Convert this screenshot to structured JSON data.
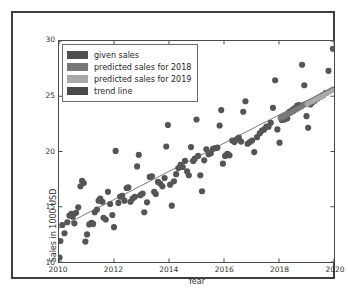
{
  "chart_data": {
    "type": "scatter",
    "title": "",
    "xlabel": "Year",
    "ylabel": "Sales in 1000 USD",
    "xlim": [
      2010,
      2020
    ],
    "ylim": [
      10,
      30
    ],
    "xticks": [
      "2010",
      "2012",
      "2014",
      "2016",
      "2018",
      "2020"
    ],
    "xtick_values": [
      2010,
      2012,
      2014,
      2016,
      2018,
      2020
    ],
    "yticks": [
      "10",
      "15",
      "20",
      "25",
      "30"
    ],
    "ytick_values": [
      10,
      15,
      20,
      25,
      30
    ],
    "grid": false,
    "legend_position": "upper left",
    "legend": [
      {
        "label": "given sales",
        "color": "#4f4f4f"
      },
      {
        "label": "predicted sales for 2018",
        "color": "#777777"
      },
      {
        "label": "predicted sales for 2019",
        "color": "#a8a8a8"
      },
      {
        "label": "trend line",
        "color": "#4a4a4a"
      }
    ],
    "series": [
      {
        "name": "given sales",
        "type": "scatter",
        "color": "#555555",
        "marker_size": 3.1,
        "points": [
          [
            2010.02,
            10.4
          ],
          [
            2010.05,
            11.9
          ],
          [
            2010.12,
            13.35
          ],
          [
            2010.2,
            12.6
          ],
          [
            2010.3,
            13.6
          ],
          [
            2010.38,
            14.2
          ],
          [
            2010.45,
            14.35
          ],
          [
            2010.5,
            14.1
          ],
          [
            2010.56,
            13.5
          ],
          [
            2010.62,
            14.45
          ],
          [
            2010.7,
            14.95
          ],
          [
            2010.78,
            16.85
          ],
          [
            2010.84,
            17.35
          ],
          [
            2010.9,
            17.15
          ],
          [
            2010.96,
            11.85
          ],
          [
            2011.02,
            12.5
          ],
          [
            2011.1,
            13.4
          ],
          [
            2011.18,
            13.55
          ],
          [
            2011.24,
            13.45
          ],
          [
            2011.3,
            14.5
          ],
          [
            2011.38,
            14.75
          ],
          [
            2011.44,
            15.55
          ],
          [
            2011.5,
            15.75
          ],
          [
            2011.58,
            15.45
          ],
          [
            2011.62,
            14.0
          ],
          [
            2011.7,
            13.85
          ],
          [
            2011.78,
            16.35
          ],
          [
            2011.86,
            15.25
          ],
          [
            2011.94,
            14.25
          ],
          [
            2012.0,
            13.15
          ],
          [
            2012.06,
            20.05
          ],
          [
            2012.16,
            15.35
          ],
          [
            2012.22,
            15.9
          ],
          [
            2012.3,
            16.0
          ],
          [
            2012.38,
            15.55
          ],
          [
            2012.46,
            16.7
          ],
          [
            2012.52,
            16.75
          ],
          [
            2012.6,
            15.45
          ],
          [
            2012.68,
            15.75
          ],
          [
            2012.76,
            15.9
          ],
          [
            2012.84,
            18.65
          ],
          [
            2012.9,
            19.7
          ],
          [
            2012.96,
            16.05
          ],
          [
            2013.04,
            16.2
          ],
          [
            2013.1,
            14.5
          ],
          [
            2013.2,
            15.4
          ],
          [
            2013.3,
            17.7
          ],
          [
            2013.38,
            17.75
          ],
          [
            2013.46,
            16.35
          ],
          [
            2013.52,
            16.15
          ],
          [
            2013.6,
            17.25
          ],
          [
            2013.68,
            17.1
          ],
          [
            2013.76,
            16.85
          ],
          [
            2013.84,
            17.6
          ],
          [
            2013.9,
            20.45
          ],
          [
            2013.96,
            22.4
          ],
          [
            2014.04,
            17.0
          ],
          [
            2014.1,
            15.1
          ],
          [
            2014.18,
            17.3
          ],
          [
            2014.26,
            17.95
          ],
          [
            2014.34,
            18.5
          ],
          [
            2014.42,
            18.8
          ],
          [
            2014.5,
            18.6
          ],
          [
            2014.58,
            19.15
          ],
          [
            2014.66,
            18.2
          ],
          [
            2014.72,
            17.85
          ],
          [
            2014.8,
            20.4
          ],
          [
            2014.88,
            19.15
          ],
          [
            2014.94,
            19.35
          ],
          [
            2015.0,
            22.9
          ],
          [
            2015.06,
            19.6
          ],
          [
            2015.14,
            17.85
          ],
          [
            2015.2,
            16.4
          ],
          [
            2015.28,
            19.2
          ],
          [
            2015.36,
            20.2
          ],
          [
            2015.44,
            19.75
          ],
          [
            2015.52,
            19.85
          ],
          [
            2015.6,
            20.25
          ],
          [
            2015.68,
            20.3
          ],
          [
            2015.76,
            20.35
          ],
          [
            2015.84,
            22.35
          ],
          [
            2015.9,
            23.75
          ],
          [
            2015.96,
            18.9
          ],
          [
            2016.04,
            19.6
          ],
          [
            2016.12,
            19.8
          ],
          [
            2016.2,
            19.65
          ],
          [
            2016.3,
            21.0
          ],
          [
            2016.38,
            20.85
          ],
          [
            2016.46,
            21.1
          ],
          [
            2016.54,
            21.25
          ],
          [
            2016.62,
            20.9
          ],
          [
            2016.7,
            23.6
          ],
          [
            2016.78,
            24.55
          ],
          [
            2016.86,
            20.7
          ],
          [
            2016.94,
            20.85
          ],
          [
            2017.02,
            21.0
          ],
          [
            2017.1,
            19.95
          ],
          [
            2017.2,
            21.3
          ],
          [
            2017.3,
            21.65
          ],
          [
            2017.38,
            21.9
          ],
          [
            2017.46,
            22.0
          ],
          [
            2017.54,
            22.25
          ],
          [
            2017.62,
            22.25
          ],
          [
            2017.7,
            22.6
          ],
          [
            2017.78,
            23.95
          ],
          [
            2017.86,
            26.45
          ],
          [
            2017.94,
            22.0
          ],
          [
            2018.02,
            20.8
          ],
          [
            2018.1,
            22.85
          ],
          [
            2018.2,
            22.9
          ],
          [
            2018.3,
            23.0
          ],
          [
            2018.38,
            23.6
          ],
          [
            2018.48,
            23.75
          ],
          [
            2018.56,
            23.9
          ],
          [
            2018.66,
            24.15
          ],
          [
            2018.74,
            24.2
          ],
          [
            2018.84,
            27.85
          ],
          [
            2018.92,
            26.0
          ],
          [
            2019.0,
            23.2
          ],
          [
            2019.06,
            22.15
          ],
          [
            2019.14,
            24.25
          ],
          [
            2019.22,
            24.45
          ],
          [
            2019.3,
            24.6
          ],
          [
            2019.4,
            24.8
          ],
          [
            2019.5,
            24.95
          ],
          [
            2019.6,
            25.1
          ],
          [
            2019.7,
            25.3
          ],
          [
            2019.8,
            27.3
          ],
          [
            2019.96,
            29.3
          ]
        ]
      },
      {
        "name": "predicted sales for 2018",
        "type": "scatter",
        "color": "#7a7a7a",
        "marker_size": 3.1,
        "points": [
          [
            2018.06,
            23.05
          ],
          [
            2018.14,
            23.15
          ],
          [
            2018.22,
            23.25
          ],
          [
            2018.32,
            23.4
          ],
          [
            2018.42,
            23.5
          ],
          [
            2018.52,
            23.65
          ],
          [
            2018.62,
            23.8
          ],
          [
            2018.72,
            23.95
          ],
          [
            2018.82,
            24.1
          ],
          [
            2018.92,
            24.25
          ]
        ]
      },
      {
        "name": "predicted sales for 2019",
        "type": "scatter",
        "color": "#aaaaaa",
        "marker_size": 3.1,
        "points": [
          [
            2019.04,
            24.35
          ],
          [
            2019.14,
            24.5
          ],
          [
            2019.24,
            24.6
          ],
          [
            2019.34,
            24.75
          ],
          [
            2019.44,
            24.9
          ],
          [
            2019.54,
            25.0
          ],
          [
            2019.64,
            25.15
          ],
          [
            2019.74,
            25.3
          ],
          [
            2019.84,
            25.45
          ],
          [
            2019.94,
            25.6
          ]
        ]
      },
      {
        "name": "trend line",
        "type": "line",
        "color": "#5a5a5a",
        "linewidth": 0.8,
        "points": [
          [
            2010,
            13.1
          ],
          [
            2020,
            25.85
          ]
        ]
      }
    ]
  }
}
